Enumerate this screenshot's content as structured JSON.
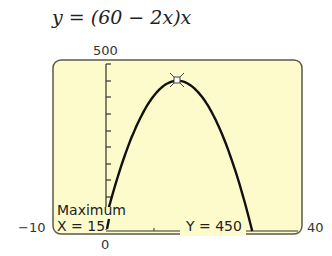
{
  "equation": {
    "prefix": "y = (60 − 2",
    "x1": "x",
    "mid": ")",
    "x2": "x"
  },
  "window": {
    "ymax_label": "500",
    "xmin_label": "−10",
    "xmax_label": "40",
    "origin_label": "0"
  },
  "calc": {
    "title": "Maximum",
    "x_readout": "X = 15",
    "y_readout": "Y = 450"
  },
  "colors": {
    "screen_bg": "#fdfbcc",
    "frame": "#5a5a4e",
    "curve": "#111111"
  },
  "chart_data": {
    "type": "line",
    "title": "y = (60 − 2x)x",
    "xlabel": "",
    "ylabel": "",
    "xlim": [
      -10,
      40
    ],
    "ylim": [
      0,
      500
    ],
    "y_tick_step": 50,
    "x_tick_step": 10,
    "series": [
      {
        "name": "y = (60 - 2x)x",
        "x": [
          0,
          5,
          10,
          15,
          20,
          25,
          30
        ],
        "y": [
          0,
          250,
          400,
          450,
          400,
          250,
          0
        ]
      }
    ],
    "annotations": [
      {
        "type": "maximum",
        "x": 15,
        "y": 450,
        "text": "Maximum X = 15 Y = 450"
      }
    ],
    "grid": false,
    "legend": "none"
  }
}
